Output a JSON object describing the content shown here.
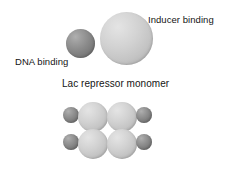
{
  "figure": {
    "background_color": "#ffffff",
    "width": 237,
    "height": 183
  },
  "colors": {
    "light_sphere": "#d2d2d2",
    "dark_sphere": "#8c8c8c",
    "text": "#141414",
    "background": "#ffffff"
  },
  "monomer": {
    "caption": "Lac repressor monomer",
    "labels": {
      "inducer": "Inducer binding",
      "dna": "DNA binding"
    },
    "spheres": [
      {
        "name": "inducer-binding-domain",
        "shade": "light",
        "diameter": 53
      },
      {
        "name": "dna-binding-domain",
        "shade": "dark",
        "diameter": 29
      }
    ]
  },
  "tetramer": {
    "caption": "Lac repressor tetramer",
    "rows": 2,
    "subunits_per_row": 2,
    "spheres": [
      {
        "name": "dna-binding-top-left",
        "shade": "dark",
        "diameter": 16
      },
      {
        "name": "inducer-binding-top-left",
        "shade": "light",
        "diameter": 30
      },
      {
        "name": "inducer-binding-top-right",
        "shade": "light",
        "diameter": 30
      },
      {
        "name": "dna-binding-top-right",
        "shade": "dark",
        "diameter": 16
      },
      {
        "name": "dna-binding-bottom-left",
        "shade": "dark",
        "diameter": 16
      },
      {
        "name": "inducer-binding-bottom-left",
        "shade": "light",
        "diameter": 30
      },
      {
        "name": "inducer-binding-bottom-right",
        "shade": "light",
        "diameter": 30
      },
      {
        "name": "dna-binding-bottom-right",
        "shade": "dark",
        "diameter": 16
      }
    ]
  }
}
